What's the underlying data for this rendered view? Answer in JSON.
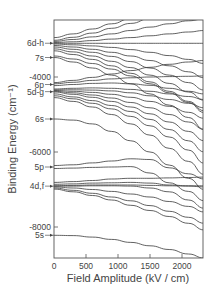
{
  "chart_data": {
    "type": "line",
    "title": "",
    "xlabel": "Field Amplitude  (kV / cm)",
    "ylabel": "Binding Energy  (cm⁻¹)",
    "xlim": [
      0,
      2350
    ],
    "ylim": [
      -8850,
      -2500
    ],
    "grid": false,
    "legend": null,
    "x_ticks": [
      0,
      500,
      1000,
      1500,
      2000
    ],
    "x_tick_labels": [
      "0",
      "500",
      "1000",
      "1500",
      "2000"
    ],
    "y_ticks": [
      -4000,
      -6000,
      -8000
    ],
    "y_tick_labels": [
      "-4000",
      "-6000",
      "-8000"
    ],
    "level_labels": [
      {
        "label": "6d-h",
        "energy": -3100
      },
      {
        "label": "7s",
        "energy": -3480
      },
      {
        "label": "6p",
        "energy": -4200
      },
      {
        "label": "5d-g",
        "energy": -4390
      },
      {
        "label": "6s",
        "energy": -5120
      },
      {
        "label": "5p",
        "energy": -6400
      },
      {
        "label": "4d,f",
        "energy": -6910
      },
      {
        "label": "5s",
        "energy": -8220
      }
    ],
    "x": [
      0,
      300,
      600,
      900,
      1200,
      1500,
      1800,
      2100,
      2350
    ],
    "series": [
      {
        "name": "5s",
        "values": [
          -8220,
          -8230,
          -8270,
          -8330,
          -8410,
          -8500,
          -8600,
          -8720,
          -8830
        ]
      },
      {
        "name": "4d,f a",
        "values": [
          -6990,
          -7060,
          -7160,
          -7280,
          -7420,
          -7560,
          -7720,
          -7900,
          -8080
        ]
      },
      {
        "name": "4d,f b",
        "values": [
          -6960,
          -7020,
          -7100,
          -7200,
          -7300,
          -7430,
          -7580,
          -7740,
          -7900
        ]
      },
      {
        "name": "4d,f c",
        "values": [
          -6930,
          -6960,
          -7000,
          -7050,
          -7120,
          -7200,
          -7320,
          -7450,
          -7600
        ]
      },
      {
        "name": "4d,f d",
        "values": [
          -6910,
          -6910,
          -6900,
          -6900,
          -6910,
          -6960,
          -7060,
          -7280,
          -7500
        ]
      },
      {
        "name": "4d,f e",
        "values": [
          -6900,
          -6890,
          -6880,
          -6880,
          -6880,
          -6890,
          -6900,
          -6910,
          -6930
        ]
      },
      {
        "name": "4d,f f",
        "values": [
          -6860,
          -6850,
          -6830,
          -6820,
          -6810,
          -6830,
          -6880,
          -6900,
          -6900
        ]
      },
      {
        "name": "4d,f g",
        "values": [
          -6810,
          -6790,
          -6760,
          -6720,
          -6700,
          -6700,
          -6690,
          -6680,
          -6670
        ]
      },
      {
        "name": "5p a",
        "values": [
          -6440,
          -6430,
          -6410,
          -6400,
          -6390,
          -6560,
          -6820,
          -7050,
          -7300
        ]
      },
      {
        "name": "5p b",
        "values": [
          -6360,
          -6340,
          -6290,
          -6240,
          -6180,
          -6200,
          -6420,
          -6580,
          -6720
        ]
      },
      {
        "name": "6s",
        "values": [
          -5120,
          -5150,
          -5250,
          -5450,
          -5700,
          -6000,
          -6350,
          -6700,
          -7000
        ]
      },
      {
        "name": "5d-g a",
        "values": [
          -4550,
          -4650,
          -4800,
          -5000,
          -5250,
          -5550,
          -5900,
          -6250,
          -6600
        ]
      },
      {
        "name": "5d-g b",
        "values": [
          -4500,
          -4580,
          -4700,
          -4850,
          -5050,
          -5300,
          -5600,
          -5950,
          -6300
        ]
      },
      {
        "name": "5d-g c",
        "values": [
          -4450,
          -4530,
          -4630,
          -4760,
          -4920,
          -5130,
          -5400,
          -5700,
          -6000
        ]
      },
      {
        "name": "5d-g d",
        "values": [
          -4400,
          -4460,
          -4540,
          -4650,
          -4800,
          -4980,
          -5200,
          -5450,
          -5700
        ]
      },
      {
        "name": "5d-g e",
        "values": [
          -4380,
          -4420,
          -4480,
          -4560,
          -4680,
          -4820,
          -5000,
          -5200,
          -5400
        ]
      },
      {
        "name": "5d-g f",
        "values": [
          -4360,
          -4380,
          -4410,
          -4460,
          -4540,
          -4650,
          -4780,
          -4940,
          -5100
        ]
      },
      {
        "name": "5d-g g",
        "values": [
          -4340,
          -4340,
          -4350,
          -4370,
          -4420,
          -4500,
          -4600,
          -4700,
          -4820
        ]
      },
      {
        "name": "5d-g h",
        "values": [
          -4320,
          -4300,
          -4290,
          -4300,
          -4330,
          -4380,
          -4450,
          -4520,
          -4600
        ]
      },
      {
        "name": "6p a",
        "values": [
          -4230,
          -4200,
          -4170,
          -4160,
          -4180,
          -4220,
          -4300,
          -4380,
          -4450
        ]
      },
      {
        "name": "6p b",
        "values": [
          -4180,
          -4140,
          -4090,
          -4050,
          -4020,
          -4000,
          -3990,
          -3980,
          -3970
        ]
      },
      {
        "name": "6p c",
        "values": [
          -4150,
          -4090,
          -4010,
          -3920,
          -3830,
          -3740,
          -3660,
          -3600,
          -3560
        ]
      },
      {
        "name": "7s a",
        "values": [
          -3480,
          -3600,
          -3760,
          -3950,
          -4180,
          -4450,
          -4750,
          -5080,
          -5400
        ]
      },
      {
        "name": "7s b",
        "values": [
          -3440,
          -3520,
          -3640,
          -3790,
          -3970,
          -4180,
          -4420,
          -4680,
          -4950
        ]
      },
      {
        "name": "6d-h a",
        "values": [
          -3300,
          -3400,
          -3530,
          -3700,
          -3900,
          -4130,
          -4380,
          -4650,
          -4900
        ]
      },
      {
        "name": "6d-h b",
        "values": [
          -3250,
          -3330,
          -3440,
          -3580,
          -3750,
          -3950,
          -4170,
          -4400,
          -4620
        ]
      },
      {
        "name": "6d-h c",
        "values": [
          -3200,
          -3260,
          -3340,
          -3450,
          -3590,
          -3760,
          -3950,
          -4150,
          -4350
        ]
      },
      {
        "name": "6d-h d",
        "values": [
          -3160,
          -3200,
          -3260,
          -3340,
          -3440,
          -3560,
          -3700,
          -3860,
          -4020
        ]
      },
      {
        "name": "6d-h e",
        "values": [
          -3120,
          -3140,
          -3170,
          -3210,
          -3270,
          -3340,
          -3430,
          -3530,
          -3640
        ]
      },
      {
        "name": "6d-h f",
        "values": [
          -3100,
          -3100,
          -3100,
          -3100,
          -3100,
          -3100,
          -3100,
          -3100,
          -3100
        ]
      },
      {
        "name": "6d-h g",
        "values": [
          -3080,
          -3060,
          -3030,
          -2990,
          -2950,
          -2900,
          -2850,
          -2800,
          -2760
        ]
      },
      {
        "name": "6d-h h",
        "values": [
          -3050,
          -3000,
          -2930,
          -2850,
          -2760,
          -2670,
          -2580,
          -2500,
          -2450
        ]
      },
      {
        "name": "6d-h i",
        "values": [
          -3020,
          -2940,
          -2830,
          -2700,
          -2570,
          -2440,
          -2320,
          -2200,
          -2100
        ]
      },
      {
        "name": "upper a",
        "values": [
          -2950,
          -2850,
          -2720,
          -2580,
          -2440,
          -2300,
          -2160,
          -2020,
          -1900
        ]
      }
    ]
  }
}
